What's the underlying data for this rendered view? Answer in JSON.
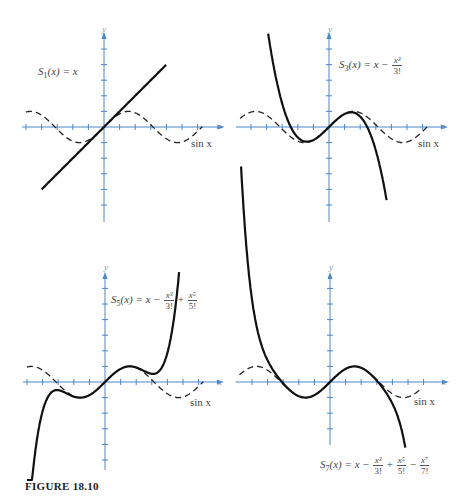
{
  "caption": "FIGURE 18.10",
  "axes": {
    "x_label": "x",
    "y_label": "y"
  },
  "colors": {
    "axis": "#4a86c8",
    "curve": "#111111",
    "sine": "#222222"
  },
  "panels": [
    {
      "id": "S1",
      "name": "S",
      "sub": "1",
      "formula_tail": "(x) = x",
      "terms": [],
      "sine_label": "sin x"
    },
    {
      "id": "S3",
      "name": "S",
      "sub": "3",
      "formula_tail": "(x) = x −",
      "terms": [
        {
          "num": "x³",
          "den": "3!"
        }
      ],
      "sine_label": "sin x"
    },
    {
      "id": "S5",
      "name": "S",
      "sub": "5",
      "formula_tail": "(x) = x −",
      "terms": [
        {
          "num": "x³",
          "den": "3!"
        },
        {
          "op": "+",
          "num": "x⁵",
          "den": "5!"
        }
      ],
      "sine_label": "sin x"
    },
    {
      "id": "S7",
      "name": "S",
      "sub": "7",
      "formula_tail": "(x) = x −",
      "terms": [
        {
          "num": "x³",
          "den": "3!"
        },
        {
          "op": "+",
          "num": "x⁵",
          "den": "5!"
        },
        {
          "op": "−",
          "num": "x⁷",
          "den": "7!"
        }
      ],
      "sine_label": "sin x"
    }
  ],
  "chart_data": [
    {
      "type": "line",
      "title": "S1(x) = x",
      "xlabel": "x",
      "ylabel": "y",
      "xlim": [
        -5.5,
        6.5
      ],
      "ylim": [
        -6,
        6
      ],
      "grid": false,
      "series": [
        {
          "name": "S1(x) = x",
          "style": "solid",
          "x": [
            -4,
            4
          ],
          "y": [
            -4,
            4
          ]
        },
        {
          "name": "sin x",
          "style": "dashed",
          "x": [
            -5.0,
            -4.71,
            -3.14,
            -1.57,
            0,
            1.57,
            3.14,
            4.71,
            6.28
          ],
          "y": [
            0.96,
            1,
            0,
            -1,
            0,
            1,
            0,
            -1,
            0
          ]
        }
      ]
    },
    {
      "type": "line",
      "title": "S3(x) = x - x^3/3!",
      "xlabel": "x",
      "ylabel": "y",
      "xlim": [
        -5.5,
        6.5
      ],
      "ylim": [
        -6,
        6
      ],
      "grid": false,
      "series": [
        {
          "name": "S3(x)",
          "style": "solid",
          "x": [
            -3.9,
            -3,
            -2,
            -1.41,
            0,
            1.41,
            2,
            3,
            3.7
          ],
          "y": [
            6.0,
            1.5,
            -0.67,
            -0.94,
            0,
            0.94,
            0.67,
            -1.5,
            -4.74
          ]
        },
        {
          "name": "sin x",
          "style": "dashed",
          "x": [
            -5.6,
            -4.71,
            -3.14,
            -1.57,
            0,
            1.57,
            3.14,
            4.71,
            6.28
          ],
          "y": [
            0.63,
            1,
            0,
            -1,
            0,
            1,
            0,
            -1,
            0
          ]
        }
      ]
    },
    {
      "type": "line",
      "title": "S5(x) = x - x^3/3! + x^5/5!",
      "xlabel": "x",
      "ylabel": "y",
      "xlim": [
        -5.5,
        6.5
      ],
      "ylim": [
        -6,
        6
      ],
      "grid": false,
      "series": [
        {
          "name": "S5(x)",
          "style": "solid",
          "x": [
            -5,
            -4,
            -3,
            -2,
            -1,
            0,
            1,
            2,
            3,
            4,
            5
          ],
          "y": [
            -6.5,
            -0.8,
            -0.5,
            -0.93,
            -0.84,
            0,
            0.84,
            0.93,
            0.53,
            0.87,
            6.5
          ]
        },
        {
          "name": "sin x",
          "style": "dashed",
          "x": [
            -5.0,
            -4.71,
            -3.14,
            -1.57,
            0,
            1.57,
            3.14,
            4.71,
            6.28
          ],
          "y": [
            0.96,
            1,
            0,
            -1,
            0,
            1,
            0,
            -1,
            0
          ]
        }
      ]
    },
    {
      "type": "line",
      "title": "S7(x) = x - x^3/3! + x^5/5! - x^7/7!",
      "xlabel": "x",
      "ylabel": "y",
      "xlim": [
        -5.5,
        6.5
      ],
      "ylim": [
        -6,
        6
      ],
      "grid": false,
      "series": [
        {
          "name": "S7(x)",
          "style": "solid",
          "x": [
            -5.7,
            -5,
            -4,
            -3,
            -2,
            -1,
            0,
            1,
            2,
            3,
            4,
            5.0
          ],
          "y": [
            4.8,
            1.5,
            -0.5,
            0.14,
            -0.91,
            -0.84,
            0,
            0.84,
            0.91,
            -0.14,
            0.5,
            -4.0
          ]
        },
        {
          "name": "sin x",
          "style": "dashed",
          "x": [
            -5.8,
            -4.71,
            -3.14,
            -1.57,
            0,
            1.57,
            3.14,
            4.71,
            6.28
          ],
          "y": [
            0.46,
            1,
            0,
            -1,
            0,
            1,
            0,
            -1,
            0
          ]
        }
      ]
    }
  ]
}
